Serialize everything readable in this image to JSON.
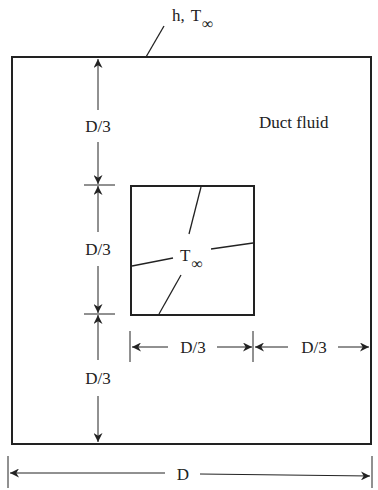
{
  "diagram": {
    "outer_label": {
      "h": "h,",
      "T": "T",
      "sub": "∞"
    },
    "region_label": "Duct fluid",
    "inner_label": {
      "T": "T",
      "sub": "∞"
    },
    "dims": {
      "left_top": "D/3",
      "left_middle": "D/3",
      "left_bottom": "D/3",
      "bottom_inner": "D/3",
      "bottom_right": "D/3",
      "overall": "D"
    },
    "colors": {
      "line": "#222222",
      "background": "#ffffff"
    }
  }
}
